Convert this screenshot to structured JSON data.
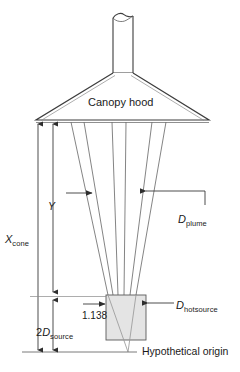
{
  "figure": {
    "labels": {
      "canopy_hood": "Canopy hood",
      "hypothetical_origin": "Hypothetical origin",
      "ratio_value": "1.138",
      "y_symbol": "Y",
      "x_cone_symbol": "X",
      "x_cone_subscript": "cone",
      "d_plume_symbol": "D",
      "d_plume_subscript": "plume",
      "d_hotsource_symbol": "D",
      "d_hotsource_subscript": "hotsource",
      "two_d_source_prefix": "2",
      "two_d_source_symbol": "D",
      "two_d_source_subscript": "source"
    },
    "colors": {
      "line": "#3d3d3d",
      "thin_line": "#6e6e6e",
      "box_fill": "#e4e4e4",
      "box_stroke": "#5a5a5a",
      "text": "#1a1a1a",
      "background": "#ffffff"
    }
  }
}
